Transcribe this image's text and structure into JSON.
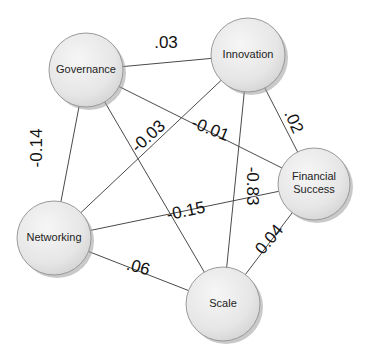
{
  "diagram": {
    "type": "network",
    "nodes": [
      {
        "id": "governance",
        "label": "Governance",
        "lines": [
          "Governance"
        ],
        "cx": 86,
        "cy": 70,
        "r": 37
      },
      {
        "id": "innovation",
        "label": "Innovation",
        "lines": [
          "Innovation"
        ],
        "cx": 248,
        "cy": 55,
        "r": 37
      },
      {
        "id": "financial",
        "label": "Financial Success",
        "lines": [
          "Financial",
          "Success"
        ],
        "cx": 314,
        "cy": 184,
        "r": 36
      },
      {
        "id": "networking",
        "label": "Networking",
        "lines": [
          "Networking"
        ],
        "cx": 54,
        "cy": 238,
        "r": 37
      },
      {
        "id": "scale",
        "label": "Scale",
        "lines": [
          "Scale"
        ],
        "cx": 223,
        "cy": 304,
        "r": 37
      }
    ],
    "edges": [
      {
        "from": "governance",
        "to": "innovation",
        "label": ".03",
        "lx": 166,
        "ly": 44,
        "rot": 0
      },
      {
        "from": "governance",
        "to": "networking",
        "label": "-0.14",
        "lx": 38,
        "ly": 148,
        "rot": -90
      },
      {
        "from": "governance",
        "to": "scale",
        "label": "",
        "lx": 0,
        "ly": 0,
        "rot": 0
      },
      {
        "from": "governance",
        "to": "financial",
        "label": "-0.01",
        "lx": 210,
        "ly": 130,
        "rot": 22
      },
      {
        "from": "innovation",
        "to": "networking",
        "label": "-0.03",
        "lx": 149,
        "ly": 137,
        "rot": -42
      },
      {
        "from": "innovation",
        "to": "scale",
        "label": "-0.83",
        "lx": 251,
        "ly": 186,
        "rot": 90
      },
      {
        "from": "innovation",
        "to": "financial",
        "label": ".02",
        "lx": 293,
        "ly": 122,
        "rot": 66
      },
      {
        "from": "networking",
        "to": "financial",
        "label": "-0.15",
        "lx": 186,
        "ly": 212,
        "rot": -12
      },
      {
        "from": "networking",
        "to": "scale",
        "label": ".06",
        "lx": 138,
        "ly": 268,
        "rot": 15
      },
      {
        "from": "scale",
        "to": "financial",
        "label": "0.04",
        "lx": 270,
        "ly": 240,
        "rot": -50
      }
    ]
  }
}
